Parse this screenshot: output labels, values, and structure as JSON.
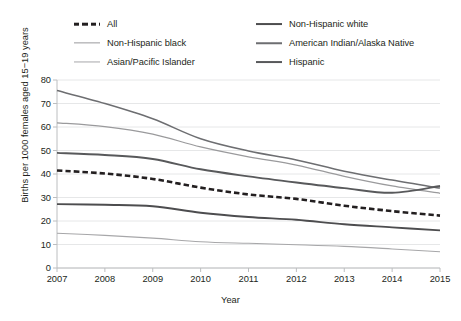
{
  "chart_data": {
    "type": "line",
    "title": "",
    "xlabel": "Year",
    "ylabel": "Births per 1000 females aged 15−19 years",
    "x": [
      2007,
      2008,
      2009,
      2010,
      2011,
      2012,
      2013,
      2014,
      2015
    ],
    "xtick_labels": [
      "2007",
      "2008",
      "2009",
      "2010",
      "2011",
      "2012",
      "2013",
      "2014",
      "2015"
    ],
    "ytick_labels": [
      "0",
      "10",
      "20",
      "30",
      "40",
      "50",
      "60",
      "70",
      "80"
    ],
    "yticks": [
      0,
      10,
      20,
      30,
      40,
      50,
      60,
      70,
      80
    ],
    "ylim": [
      0,
      80
    ],
    "xlim": [
      2007,
      2015
    ],
    "grid": "horizontal",
    "legend_position": "top",
    "legend_columns": 2,
    "series": [
      {
        "name": "All",
        "values": [
          41.5,
          40.2,
          37.9,
          34.2,
          31.3,
          29.4,
          26.5,
          24.2,
          22.3
        ],
        "color": "#231f20",
        "width": 2.6,
        "dash": "5.5,3",
        "legend_col": 1,
        "legend_row": 1
      },
      {
        "name": "Non-Hispanic white",
        "values": [
          27.2,
          26.9,
          26.3,
          23.5,
          21.7,
          20.5,
          18.6,
          17.3,
          16.0
        ],
        "color": "#4d4d4f",
        "width": 1.9,
        "dash": "none",
        "legend_col": 2,
        "legend_row": 1
      },
      {
        "name": "Non-Hispanic black",
        "values": [
          61.8,
          60.2,
          57.0,
          51.5,
          47.3,
          43.8,
          39.0,
          34.9,
          31.8
        ],
        "color": "#9a9a9c",
        "width": 1.25,
        "dash": "none",
        "legend_col": 1,
        "legend_row": 2
      },
      {
        "name": "American Indian/Alaska Native",
        "values": [
          75.5,
          70.0,
          63.5,
          55.0,
          49.8,
          46.0,
          41.2,
          37.4,
          34.0
        ],
        "color": "#6d6e71",
        "width": 1.5,
        "dash": "none",
        "legend_col": 2,
        "legend_row": 2
      },
      {
        "name": "Asian/Pacific Islander",
        "values": [
          14.8,
          13.9,
          12.7,
          11.2,
          10.5,
          9.9,
          9.2,
          8.1,
          6.9
        ],
        "color": "#a7a7a9",
        "width": 1.1,
        "dash": "none",
        "legend_col": 1,
        "legend_row": 3
      },
      {
        "name": "Hispanic",
        "values": [
          49.0,
          48.1,
          46.4,
          42.0,
          39.0,
          36.4,
          34.0,
          32.0,
          34.9
        ],
        "color": "#58595b",
        "width": 1.9,
        "dash": "none",
        "legend_col": 2,
        "legend_row": 3
      }
    ]
  },
  "axes": {
    "ylabel": "Births per 1000 females aged 15−19 years",
    "xlabel": "Year",
    "axis_color": "#bcbec0",
    "grid_color": "#e6e7e8"
  }
}
